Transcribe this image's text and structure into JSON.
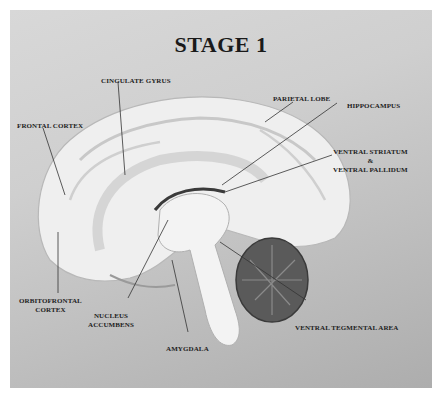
{
  "title": "STAGE 1",
  "labels": {
    "cingulate_gyrus": "CINGULATE GYRUS",
    "frontal_cortex": "FRONTAL CORTEX",
    "parietal_lobe": "PARIETAL LOBE",
    "hippocampus": "HIPPOCAMPUS",
    "ventral_striatum_line1": "VENTRAL STRIATUM",
    "ventral_striatum_line2": "&",
    "ventral_striatum_line3": "VENTRAL PALLIDUM",
    "orbitofrontal_line1": "ORBITOFRONTAL",
    "orbitofrontal_line2": "CORTEX",
    "nucleus_line1": "NUCLEUS",
    "nucleus_line2": "ACCUMBENS",
    "amygdala": "AMYGDALA",
    "vta": "VENTRAL TEGMENTAL AREA"
  },
  "colors": {
    "background": "#cfcfcf",
    "brain": "#eeeeee",
    "cerebellum": "#5a5a5a",
    "text": "#222222"
  }
}
